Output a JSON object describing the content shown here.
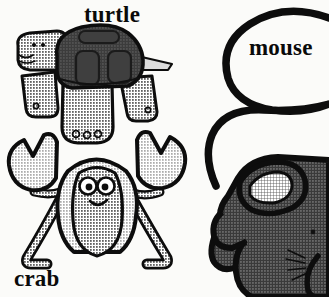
{
  "page": {
    "background_color": "#fbfbf9",
    "width": 329,
    "height": 297
  },
  "palette": {
    "ink": "#0a0a0a",
    "outline": "#111111",
    "dark_fill": "#4a4a4a",
    "mid_fill": "#5c5c5c",
    "light_fill": "#c9c9c9",
    "pale_fill": "#dedede",
    "white": "#ffffff",
    "background": "#fbfbf9"
  },
  "labels": {
    "turtle": "turtle",
    "crab": "crab",
    "mouse": "mouse"
  },
  "figures": [
    {
      "name": "turtle",
      "label": "turtle",
      "fill_style": "dark shell with light halftone head, legs and body",
      "parts": [
        "head",
        "shell",
        "shell-panels",
        "front-leg",
        "rear-leg",
        "belly-foot",
        "tail",
        "eyes",
        "mouth",
        "toes"
      ],
      "toe_count": 3
    },
    {
      "name": "crab",
      "label": "crab",
      "fill_style": "light halftone body with black outline",
      "parts": [
        "body",
        "left-claw",
        "right-claw",
        "left-arm",
        "right-arm",
        "left-leg",
        "right-leg",
        "eyes",
        "mouth"
      ],
      "claw_count": 2,
      "leg_count": 2
    },
    {
      "name": "mouse",
      "label": "mouse",
      "fill_style": "dark halftone body with pale crosshatch inner ear",
      "parts": [
        "body",
        "ear",
        "inner-ear",
        "snout",
        "front-paw",
        "hind-paw",
        "tail-loop",
        "whiskers",
        "eye"
      ],
      "whisker_count": 4
    }
  ]
}
